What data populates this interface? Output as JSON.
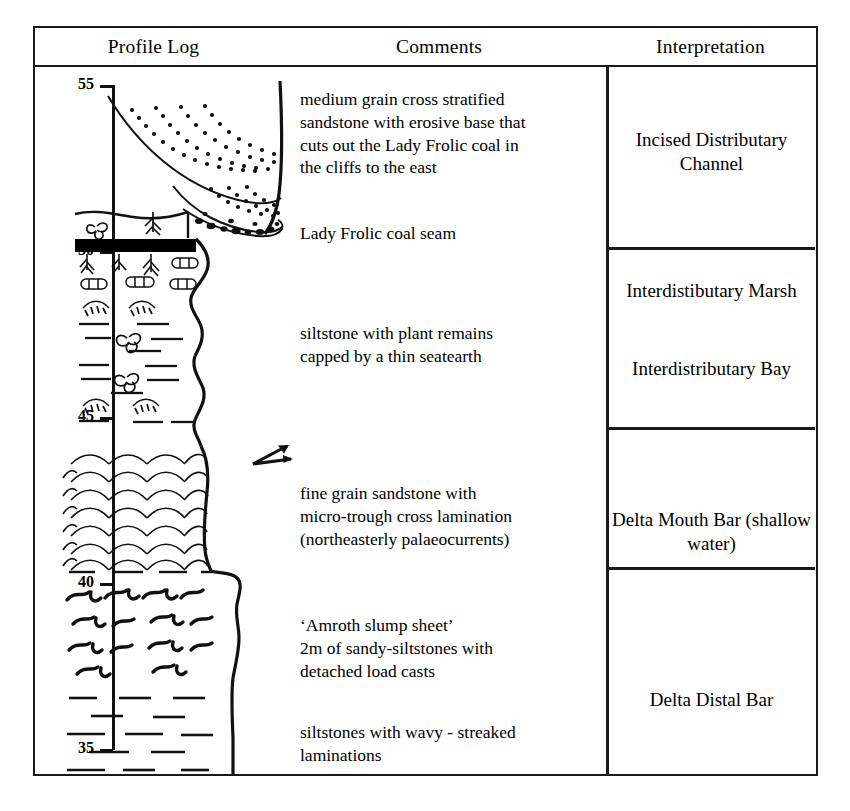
{
  "figure": {
    "columns": [
      {
        "id": "profile-log",
        "label": "Profile Log"
      },
      {
        "id": "comments",
        "label": "Comments"
      },
      {
        "id": "interpretation",
        "label": "Interpretation"
      }
    ]
  },
  "axis": {
    "unit": "m",
    "direction": "depth-up",
    "ticks": [
      {
        "value": "55",
        "y": 85
      },
      {
        "value": "50",
        "y": 251
      },
      {
        "value": "45",
        "y": 417
      },
      {
        "value": "40",
        "y": 583
      },
      {
        "value": "35",
        "y": 749
      }
    ]
  },
  "comments": [
    {
      "id": "comment-channel-sandstone",
      "text": "medium grain cross stratified\nsandstone with erosive base that\ncuts out the Lady Frolic coal in\nthe cliffs to the east",
      "top": 88
    },
    {
      "id": "comment-coal-seam",
      "text": "Lady Frolic coal seam",
      "top": 222
    },
    {
      "id": "comment-siltstone-plant",
      "text": "siltstone with  plant remains\ncapped by a thin seatearth",
      "top": 322
    },
    {
      "id": "comment-fine-sandstone",
      "text": "fine grain sandstone with\nmicro-trough cross lamination\n(northeasterly palaeocurrents)",
      "top": 482
    },
    {
      "id": "comment-slump-sheet",
      "text": "‘Amroth slump sheet’\n 2m of sandy-siltstones with\ndetached load casts",
      "top": 614
    },
    {
      "id": "comment-wavy-siltstone",
      "text": "siltstones with wavy - streaked\nlaminations",
      "top": 721
    }
  ],
  "interpretations": [
    {
      "id": "interp-incised-channel",
      "text": "Incised Distributary\nChannel",
      "top": 100
    },
    {
      "id": "interp-interdist-marsh",
      "text": "Interdistibutary\nMarsh",
      "top": 251
    },
    {
      "id": "interp-interdist-bay",
      "text": "Interdistributary\nBay",
      "top": 329
    },
    {
      "id": "interp-delta-mouth-bar",
      "text": "Delta Mouth Bar\n(shallow water)",
      "top": 480
    },
    {
      "id": "interp-delta-distal-bar",
      "text": "Delta Distal Bar",
      "top": 660
    }
  ],
  "dividers": [
    {
      "id": "divider-marsh",
      "y": 219
    },
    {
      "id": "divider-mouth-bar",
      "y": 399
    },
    {
      "id": "divider-distal-bar",
      "y": 539
    }
  ],
  "lithology_units": [
    {
      "id": "unit-cross-stratified-sandstone",
      "pattern": "dotted-foreset-cross-beds",
      "top_m": "55",
      "base_m": "51"
    },
    {
      "id": "unit-pebble-lag",
      "pattern": "basal-pebble-conglomerate",
      "top_m": "51.5",
      "base_m": "51"
    },
    {
      "id": "unit-seatearth",
      "pattern": "rootlets",
      "top_m": "51",
      "base_m": "50.6"
    },
    {
      "id": "unit-coal-seam",
      "pattern": "solid-black-coal",
      "top_m": "50.6",
      "base_m": "50.3"
    },
    {
      "id": "unit-rooted-siltstone",
      "pattern": "rootlets-and-ironstone-nodules",
      "top_m": "50.3",
      "base_m": "49"
    },
    {
      "id": "unit-siltstone-plant-shells",
      "pattern": "siltstone-dashes-with-plant-and-shell-fossils",
      "top_m": "49",
      "base_m": "44.5"
    },
    {
      "id": "unit-micro-trough-sandstone",
      "pattern": "micro-trough-cross-lamination",
      "top_m": "44.5",
      "base_m": "40"
    },
    {
      "id": "unit-slump-sheet",
      "pattern": "contorted-slump-structures",
      "top_m": "40",
      "base_m": "38"
    },
    {
      "id": "unit-wavy-siltstone",
      "pattern": "siltstone-dashes",
      "top_m": "38",
      "base_m": "35"
    }
  ],
  "palaeocurrent": {
    "id": "palaeocurrent-arrow",
    "direction": "northeasterly",
    "label": ""
  }
}
